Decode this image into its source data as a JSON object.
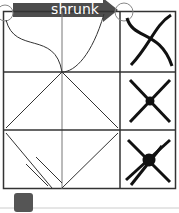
{
  "banner": {
    "label": "shrunk",
    "color": "#4d4d4d"
  },
  "grid": {
    "rows": 3,
    "cols": 3,
    "line_color": "#333333"
  },
  "icons": [
    "curved-arrows-icon",
    "cross-arrows-icon",
    "cross-arrows-offset-icon"
  ],
  "slider": {
    "handle_color": "#555555"
  }
}
